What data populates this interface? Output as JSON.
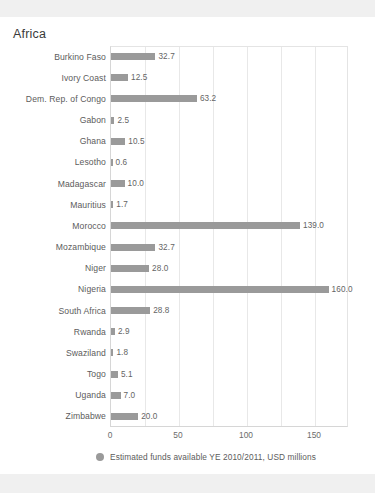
{
  "chart_data": {
    "type": "bar",
    "orientation": "horizontal",
    "title": "Africa",
    "xlabel": "",
    "ylabel": "",
    "xlim": [
      0,
      175
    ],
    "grid": true,
    "gridlines_minor_step": 25,
    "xtick_labels": [
      "0",
      "50",
      "100",
      "150"
    ],
    "xtick_values": [
      0,
      50,
      100,
      150
    ],
    "legend_position": "bottom-left",
    "legend": [
      "Estimated funds available YE 2010/2011, USD millions"
    ],
    "bar_color": "#9a9a9a",
    "categories": [
      "Burkino Faso",
      "Ivory Coast",
      "Dem. Rep. of Congo",
      "Gabon",
      "Ghana",
      "Lesotho",
      "Madagascar",
      "Mauritius",
      "Morocco",
      "Mozambique",
      "Niger",
      "Nigeria",
      "South Africa",
      "Rwanda",
      "Swaziland",
      "Togo",
      "Uganda",
      "Zimbabwe"
    ],
    "values": [
      32.7,
      12.5,
      63.2,
      2.5,
      10.5,
      0.6,
      10.0,
      1.7,
      139.0,
      32.7,
      28.0,
      160.0,
      28.8,
      2.9,
      1.8,
      5.1,
      7.0,
      20.0
    ],
    "value_labels": [
      "32.7",
      "12.5",
      "63.2",
      "2.5",
      "10.5",
      "0.6",
      "10.0",
      "1.7",
      "139.0",
      "32.7",
      "28.0",
      "160.0",
      "28.8",
      "2.9",
      "1.8",
      "5.1",
      "7.0",
      "20.0"
    ],
    "series": [
      {
        "name": "Estimated funds available YE 2010/2011, USD millions",
        "values": [
          32.7,
          12.5,
          63.2,
          2.5,
          10.5,
          0.6,
          10.0,
          1.7,
          139.0,
          32.7,
          28.0,
          160.0,
          28.8,
          2.9,
          1.8,
          5.1,
          7.0,
          20.0
        ]
      }
    ]
  }
}
